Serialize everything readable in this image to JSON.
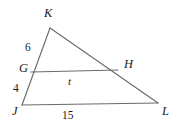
{
  "figure": {
    "kind": "geometry-diagram",
    "shape": "triangle-with-midsegment",
    "stroke_color": "#6b6b6b",
    "stroke_color_dark": "#4a4a4a",
    "text_color": "#1a1a1a",
    "background_color": "#ffffff",
    "vertices": {
      "K": {
        "label": "K",
        "x": 50,
        "y": 28
      },
      "J": {
        "label": "J",
        "x": 22,
        "y": 105
      },
      "L": {
        "label": "L",
        "x": 158,
        "y": 103
      },
      "G": {
        "label": "G",
        "x": 31,
        "y": 72
      },
      "H": {
        "label": "H",
        "x": 118,
        "y": 70
      }
    },
    "vertex_labels": [
      {
        "name": "vertex-label-K",
        "text": "K",
        "x": 44,
        "y": 7
      },
      {
        "name": "vertex-label-G",
        "text": "G",
        "x": 19,
        "y": 62
      },
      {
        "name": "vertex-label-H",
        "text": "H",
        "x": 124,
        "y": 58
      },
      {
        "name": "vertex-label-J",
        "text": "J",
        "x": 12,
        "y": 105
      },
      {
        "name": "vertex-label-L",
        "text": "L",
        "x": 162,
        "y": 105
      }
    ],
    "measure_labels": [
      {
        "name": "segment-length-KG",
        "text": "6",
        "x": 25,
        "y": 42,
        "segment": "KG"
      },
      {
        "name": "segment-length-GJ",
        "text": "4",
        "x": 13,
        "y": 83,
        "segment": "GJ"
      },
      {
        "name": "segment-length-GH",
        "text": "t",
        "x": 68,
        "y": 76,
        "segment": "GH"
      },
      {
        "name": "segment-length-JL",
        "text": "15",
        "x": 62,
        "y": 109,
        "segment": "JL"
      }
    ],
    "edges": [
      {
        "name": "edge-J-K",
        "from": "J",
        "to": "K"
      },
      {
        "name": "edge-K-L",
        "from": "K",
        "to": "L"
      },
      {
        "name": "edge-J-L",
        "from": "J",
        "to": "L"
      },
      {
        "name": "edge-G-H",
        "from": "G",
        "to": "H"
      }
    ]
  }
}
